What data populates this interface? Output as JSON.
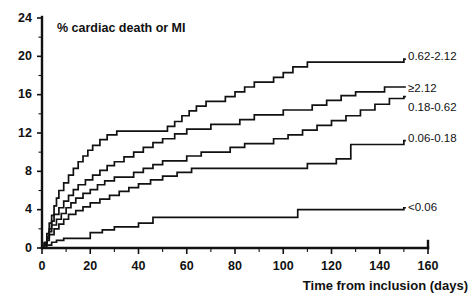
{
  "chart_data": {
    "type": "line",
    "subtype": "step-cumulative-incidence",
    "title": "% cardiac death or MI",
    "xlabel": "Time from inclusion (days)",
    "ylabel": "",
    "xlim": [
      0,
      160
    ],
    "ylim": [
      0,
      24
    ],
    "xticks": [
      0,
      20,
      40,
      60,
      80,
      100,
      120,
      140,
      160
    ],
    "xtick_labels": [
      "0",
      "20",
      "40",
      "60",
      "80",
      "100",
      "120",
      "140",
      "160"
    ],
    "xtick_minor_step": 10,
    "yticks": [
      0,
      4,
      8,
      12,
      16,
      20,
      24
    ],
    "ytick_labels": [
      "0",
      "4",
      "8",
      "12",
      "16",
      "20",
      "24"
    ],
    "ytick_minor_step": 2,
    "grid": false,
    "legend_position": "right-inline-end-of-curve",
    "series": [
      {
        "name": "0.62-2.12",
        "label": "0.62-2.12",
        "end_value": 19.7,
        "label_y": 19.9,
        "points": [
          [
            0,
            0
          ],
          [
            1,
            0.6
          ],
          [
            2,
            1.5
          ],
          [
            3,
            2.6
          ],
          [
            4,
            3.4
          ],
          [
            5,
            4.4
          ],
          [
            6,
            5.2
          ],
          [
            7,
            6.0
          ],
          [
            9,
            6.8
          ],
          [
            11,
            7.6
          ],
          [
            13,
            8.3
          ],
          [
            15,
            9.0
          ],
          [
            17,
            9.6
          ],
          [
            19,
            10.2
          ],
          [
            21,
            10.7
          ],
          [
            24,
            11.3
          ],
          [
            27,
            11.8
          ],
          [
            31,
            12.2
          ],
          [
            36,
            12.2
          ],
          [
            42,
            12.2
          ],
          [
            48,
            12.2
          ],
          [
            52,
            12.7
          ],
          [
            55,
            13.2
          ],
          [
            58,
            13.8
          ],
          [
            61,
            14.3
          ],
          [
            64,
            14.8
          ],
          [
            68,
            15.3
          ],
          [
            72,
            15.3
          ],
          [
            76,
            15.8
          ],
          [
            80,
            16.3
          ],
          [
            84,
            16.8
          ],
          [
            88,
            17.3
          ],
          [
            92,
            17.3
          ],
          [
            96,
            17.8
          ],
          [
            100,
            18.3
          ],
          [
            104,
            18.9
          ],
          [
            110,
            19.4
          ],
          [
            120,
            19.4
          ],
          [
            130,
            19.4
          ],
          [
            140,
            19.4
          ],
          [
            148,
            19.4
          ],
          [
            150,
            19.7
          ]
        ]
      },
      {
        "name": ">=2.12",
        "label": "≥2.12",
        "end_value": 16.8,
        "label_y": 16.6,
        "points": [
          [
            0,
            0
          ],
          [
            1,
            0.5
          ],
          [
            2,
            1.2
          ],
          [
            3,
            2.0
          ],
          [
            4,
            2.8
          ],
          [
            5,
            3.5
          ],
          [
            7,
            4.2
          ],
          [
            9,
            4.9
          ],
          [
            11,
            5.5
          ],
          [
            13,
            6.1
          ],
          [
            15,
            6.6
          ],
          [
            18,
            7.1
          ],
          [
            21,
            7.6
          ],
          [
            24,
            8.1
          ],
          [
            27,
            8.6
          ],
          [
            30,
            9.0
          ],
          [
            34,
            9.5
          ],
          [
            38,
            10.0
          ],
          [
            42,
            10.5
          ],
          [
            46,
            11.0
          ],
          [
            50,
            11.4
          ],
          [
            55,
            11.9
          ],
          [
            60,
            12.4
          ],
          [
            64,
            12.4
          ],
          [
            70,
            12.9
          ],
          [
            76,
            12.9
          ],
          [
            82,
            13.4
          ],
          [
            88,
            13.9
          ],
          [
            94,
            13.9
          ],
          [
            100,
            14.4
          ],
          [
            106,
            14.4
          ],
          [
            112,
            14.9
          ],
          [
            118,
            15.4
          ],
          [
            124,
            15.9
          ],
          [
            130,
            16.3
          ],
          [
            136,
            16.3
          ],
          [
            142,
            16.8
          ],
          [
            150,
            16.8
          ]
        ]
      },
      {
        "name": "0.18-0.62",
        "label": "0.18-0.62",
        "end_value": 15.8,
        "label_y": 14.6,
        "points": [
          [
            0,
            0
          ],
          [
            1,
            0.4
          ],
          [
            2,
            1.0
          ],
          [
            3,
            1.7
          ],
          [
            4,
            2.4
          ],
          [
            6,
            3.0
          ],
          [
            8,
            3.6
          ],
          [
            10,
            4.2
          ],
          [
            12,
            4.7
          ],
          [
            14,
            5.2
          ],
          [
            17,
            5.7
          ],
          [
            20,
            6.1
          ],
          [
            23,
            6.6
          ],
          [
            26,
            7.0
          ],
          [
            30,
            7.4
          ],
          [
            34,
            7.4
          ],
          [
            38,
            7.9
          ],
          [
            42,
            8.3
          ],
          [
            46,
            8.7
          ],
          [
            50,
            9.1
          ],
          [
            55,
            9.1
          ],
          [
            60,
            9.6
          ],
          [
            66,
            10.0
          ],
          [
            72,
            10.0
          ],
          [
            78,
            10.5
          ],
          [
            84,
            10.9
          ],
          [
            90,
            10.9
          ],
          [
            96,
            11.4
          ],
          [
            102,
            11.8
          ],
          [
            108,
            12.3
          ],
          [
            114,
            12.8
          ],
          [
            120,
            13.3
          ],
          [
            126,
            13.8
          ],
          [
            132,
            14.4
          ],
          [
            138,
            15.0
          ],
          [
            144,
            15.6
          ],
          [
            150,
            15.8
          ]
        ]
      },
      {
        "name": "0.06-0.18",
        "label": "0.06-0.18",
        "end_value": 11.2,
        "label_y": 11.4,
        "points": [
          [
            0,
            0
          ],
          [
            1,
            0.3
          ],
          [
            2,
            0.8
          ],
          [
            3,
            1.4
          ],
          [
            5,
            2.0
          ],
          [
            7,
            2.5
          ],
          [
            9,
            3.0
          ],
          [
            11,
            3.5
          ],
          [
            14,
            3.9
          ],
          [
            17,
            4.3
          ],
          [
            20,
            4.7
          ],
          [
            24,
            5.1
          ],
          [
            28,
            5.5
          ],
          [
            32,
            5.9
          ],
          [
            36,
            6.3
          ],
          [
            40,
            6.7
          ],
          [
            45,
            7.1
          ],
          [
            50,
            7.5
          ],
          [
            56,
            7.9
          ],
          [
            62,
            8.3
          ],
          [
            68,
            8.3
          ],
          [
            74,
            8.3
          ],
          [
            80,
            8.3
          ],
          [
            86,
            8.3
          ],
          [
            92,
            8.3
          ],
          [
            98,
            8.3
          ],
          [
            104,
            8.3
          ],
          [
            110,
            8.8
          ],
          [
            116,
            8.8
          ],
          [
            122,
            9.3
          ],
          [
            128,
            10.8
          ],
          [
            134,
            10.8
          ],
          [
            140,
            10.8
          ],
          [
            146,
            10.8
          ],
          [
            150,
            11.2
          ]
        ]
      },
      {
        "name": "<0.06",
        "label": "<0.06",
        "end_value": 4.2,
        "label_y": 4.2,
        "points": [
          [
            0,
            0
          ],
          [
            2,
            0.3
          ],
          [
            4,
            0.6
          ],
          [
            6,
            0.8
          ],
          [
            9,
            1.0
          ],
          [
            13,
            1.0
          ],
          [
            17,
            1.0
          ],
          [
            20,
            1.6
          ],
          [
            25,
            1.9
          ],
          [
            30,
            2.2
          ],
          [
            35,
            2.2
          ],
          [
            40,
            2.6
          ],
          [
            46,
            3.2
          ],
          [
            52,
            3.2
          ],
          [
            60,
            3.2
          ],
          [
            70,
            3.2
          ],
          [
            80,
            3.2
          ],
          [
            90,
            3.2
          ],
          [
            100,
            3.2
          ],
          [
            106,
            4.0
          ],
          [
            115,
            4.0
          ],
          [
            125,
            4.0
          ],
          [
            135,
            4.0
          ],
          [
            145,
            4.0
          ],
          [
            150,
            4.2
          ]
        ]
      }
    ]
  }
}
